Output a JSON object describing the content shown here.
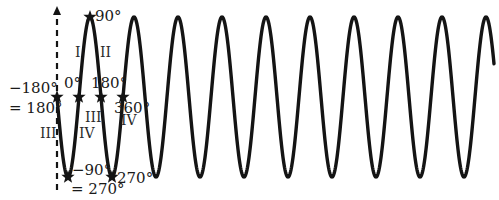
{
  "diagram": {
    "colors": {
      "curve": "#141414",
      "axis": "#141414",
      "background": "#ffffff"
    },
    "wave": {
      "x_start": 57,
      "x_end": 494,
      "midline_y": 97,
      "amplitude_px": 80,
      "period_px": 44,
      "zero_phase_x": 79
    },
    "axis": {
      "style": "dashed",
      "arrow": "up"
    },
    "angle_labels": {
      "peak": "90°",
      "zero": "0°",
      "neg180": "−180°",
      "neg180_eq": "= 180°",
      "pos180": "180°",
      "pos360": "360°",
      "neg90": "−90°",
      "neg90_eq": "= 270°",
      "trough270": "270°"
    },
    "quadrant_labels": {
      "q1": "I",
      "q2": "II",
      "q3_left": "III",
      "q4_left": "IV",
      "q3_right": "III",
      "q4_right": "IV"
    },
    "markers": [
      {
        "name": "marker-neg180",
        "x": 57,
        "y": 97
      },
      {
        "name": "marker-0",
        "x": 79,
        "y": 97
      },
      {
        "name": "marker-180",
        "x": 101,
        "y": 97
      },
      {
        "name": "marker-360",
        "x": 123,
        "y": 97
      },
      {
        "name": "marker-90",
        "x": 90,
        "y": 17
      },
      {
        "name": "marker-neg90",
        "x": 68,
        "y": 177
      },
      {
        "name": "marker-270",
        "x": 112,
        "y": 177
      }
    ]
  }
}
